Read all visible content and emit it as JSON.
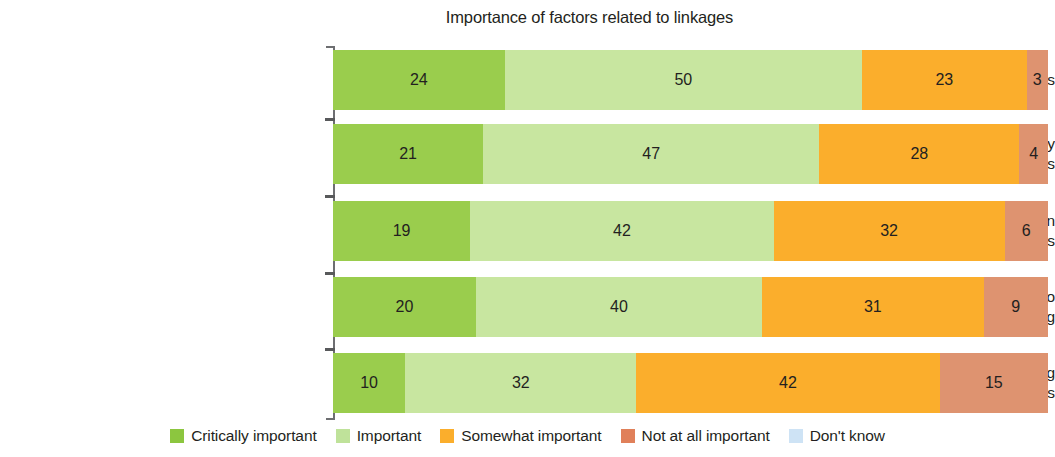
{
  "chart_data": {
    "type": "bar",
    "subtype": "stacked-horizontal-100",
    "title": "Importance of factors related to linkages",
    "xlabel": "",
    "ylabel": "",
    "xlim": [
      0,
      100
    ],
    "grid": false,
    "legend_position": "bottom",
    "categories": [
      "Capacity and skills of local suppliers",
      "Information about the availability of local suppliers",
      "Proactive government role in upgrading potential suppliers",
      "Incentives from government to invest in supplier upgrading",
      "Government-organized matchmaking events with potential suppliers"
    ],
    "category_lines": [
      [
        "Capacity and skills of local suppliers"
      ],
      [
        "Information about the availability",
        "of local suppliers"
      ],
      [
        "Proactive government role in",
        "upgrading potential suppliers"
      ],
      [
        "Incentives from government to",
        "invest in supplier upgrading"
      ],
      [
        "Government-organized matchmaking",
        "events with potential suppliers"
      ]
    ],
    "series": [
      {
        "name": "Critically important",
        "color": "#9ACD4D",
        "values": [
          24,
          21,
          19,
          20,
          10
        ]
      },
      {
        "name": "Important",
        "color": "#C8E6A0",
        "values": [
          50,
          47,
          42,
          40,
          32
        ]
      },
      {
        "name": "Somewhat important",
        "color": "#FBAE2C",
        "values": [
          23,
          28,
          32,
          31,
          42
        ]
      },
      {
        "name": "Not at all important",
        "color": "#DE9370",
        "values": [
          3,
          4,
          6,
          9,
          15
        ]
      },
      {
        "name": "Don't know",
        "color": "#CEE3F5",
        "values": [
          0,
          0,
          0,
          0,
          0
        ]
      }
    ],
    "legend": [
      {
        "label": "Critically important",
        "color": "#8CC63F"
      },
      {
        "label": "Important",
        "color": "#BFE29A"
      },
      {
        "label": "Somewhat important",
        "color": "#FBAE2C"
      },
      {
        "label": "Not at all important",
        "color": "#E0805A"
      },
      {
        "label": "Don't know",
        "color": "#CEE3F5"
      }
    ]
  }
}
